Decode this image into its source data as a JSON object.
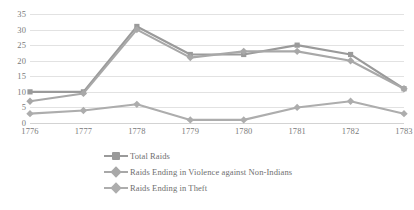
{
  "chart_data": {
    "type": "line",
    "title": "",
    "subtitle": "",
    "xlabel": "",
    "ylabel": "",
    "categories": [
      "1776",
      "1777",
      "1778",
      "1779",
      "1780",
      "1781",
      "1782",
      "1783"
    ],
    "ylim": [
      0,
      35
    ],
    "ytick_values": [
      0,
      5,
      10,
      15,
      20,
      25,
      30,
      35
    ],
    "ytick_labels": [
      "0",
      "5",
      "10",
      "15",
      "20",
      "25",
      "30",
      "35"
    ],
    "grid": "horizontal",
    "legend_position": "bottom-left",
    "series": [
      {
        "name": "Total Raids",
        "values": [
          10,
          10,
          31,
          22,
          22,
          25,
          22,
          11
        ],
        "color": "#9a9a9a",
        "marker": "square"
      },
      {
        "name": "Raids Ending in Violence against Non-Indians",
        "values": [
          7,
          9.5,
          30,
          21,
          23,
          23,
          20,
          11
        ],
        "color": "#a8a8a8",
        "marker": "diamond"
      },
      {
        "name": "Raids Ending in Theft",
        "values": [
          3,
          4,
          6,
          1,
          1,
          5,
          7,
          3
        ],
        "color": "#adadad",
        "marker": "diamond"
      }
    ]
  },
  "legend": {
    "items": [
      {
        "label": "Total Raids"
      },
      {
        "label": "Raids Ending in Violence against Non-Indians"
      },
      {
        "label": "Raids Ending in Theft"
      }
    ]
  },
  "colors": {
    "gridline": "#e2e2e2",
    "axis": "#d3d3d3",
    "tick_text": "#7a7a7a",
    "legend_text": "#6f6f6f",
    "background": "#ffffff"
  }
}
